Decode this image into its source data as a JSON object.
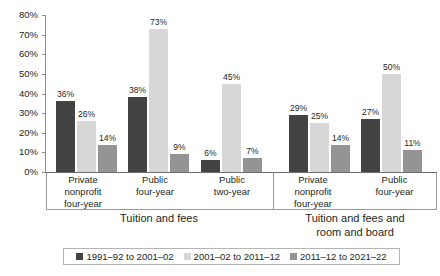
{
  "chart_data": {
    "type": "bar",
    "title": "",
    "xlabel": "",
    "ylabel": "",
    "ylim": [
      0,
      80
    ],
    "ytick_labels": [
      "80%",
      "70%",
      "60%",
      "50%",
      "40%",
      "30%",
      "20%",
      "10%",
      "0%"
    ],
    "ytick_values": [
      80,
      70,
      60,
      50,
      40,
      30,
      20,
      10,
      0
    ],
    "grid": false,
    "legend_position": "bottom",
    "categories": [
      "Private nonprofit four-year",
      "Public four-year",
      "Public two-year",
      "Private nonprofit four-year",
      "Public four-year"
    ],
    "series": [
      {
        "name": "1991–92 to 2001–02",
        "color": "#434343",
        "values": [
          36,
          38,
          6,
          29,
          27
        ]
      },
      {
        "name": "2001–02 to 2011–12",
        "color": "#d7d7d7",
        "values": [
          26,
          73,
          45,
          25,
          50
        ]
      },
      {
        "name": "2011–12 to 2021–22",
        "color": "#949494",
        "values": [
          14,
          9,
          7,
          14,
          11
        ]
      }
    ],
    "value_labels": [
      [
        "36%",
        "26%",
        "14%"
      ],
      [
        "38%",
        "73%",
        "9%"
      ],
      [
        "6%",
        "45%",
        "7%"
      ],
      [
        "29%",
        "25%",
        "14%"
      ],
      [
        "27%",
        "50%",
        "11%"
      ]
    ],
    "sections": [
      {
        "title": "Tuition and fees",
        "title_line1": "Tuition and fees",
        "title_line2": "",
        "category_count": 3
      },
      {
        "title": "Tuition and fees and room and board",
        "title_line1": "Tuition and fees and",
        "title_line2": "room and board",
        "category_count": 2
      }
    ]
  },
  "axis": {
    "ticks": [
      {
        "label": "80%",
        "value": 80
      },
      {
        "label": "70%",
        "value": 70
      },
      {
        "label": "60%",
        "value": 60
      },
      {
        "label": "50%",
        "value": 50
      },
      {
        "label": "40%",
        "value": 40
      },
      {
        "label": "30%",
        "value": 30
      },
      {
        "label": "20%",
        "value": 20
      },
      {
        "label": "10%",
        "value": 10
      },
      {
        "label": "0%",
        "value": 0
      }
    ]
  },
  "category_labels": [
    {
      "line1": "Private",
      "line2": "nonprofit",
      "line3": "four-year"
    },
    {
      "line1": "Public",
      "line2": "four-year",
      "line3": ""
    },
    {
      "line1": "Public",
      "line2": "two-year",
      "line3": ""
    },
    {
      "line1": "Private",
      "line2": "nonprofit",
      "line3": "four-year"
    },
    {
      "line1": "Public",
      "line2": "four-year",
      "line3": ""
    }
  ],
  "section_titles": {
    "left_line1": "Tuition and fees",
    "left_line2": "",
    "right_line1": "Tuition and fees and",
    "right_line2": "room and board"
  },
  "legend": {
    "items": [
      {
        "label": "1991–92 to 2001–02",
        "color": "#434343"
      },
      {
        "label": "2001–02 to 2011–12",
        "color": "#d7d7d7"
      },
      {
        "label": "2011–12 to 2021–22",
        "color": "#949494"
      }
    ]
  },
  "colors": {
    "series_1": "#434343",
    "series_2": "#d7d7d7",
    "series_3": "#949494",
    "axis": "#8d8d8d",
    "text": "#231f20",
    "background": "#ffffff"
  }
}
